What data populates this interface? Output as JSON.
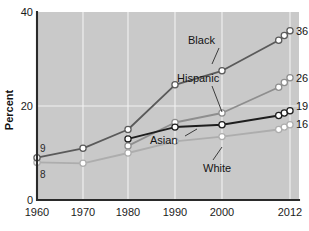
{
  "figure": {
    "plot_bg": "#c9c9c9",
    "page_bg": "#ffffff",
    "grid_color": "#f2f2f2",
    "axis_color": "#2a2a2a"
  },
  "axes": {
    "ylabel": "Percent",
    "yticks": [
      "0",
      "20",
      "40"
    ],
    "xticks": [
      "1960",
      "1970",
      "1980",
      "1990",
      "2000",
      "2012"
    ]
  },
  "start_labels": [
    {
      "text": "9",
      "series": "Black"
    },
    {
      "text": "8",
      "series": "White"
    }
  ],
  "end_labels": [
    {
      "text": "36",
      "series": "Black"
    },
    {
      "text": "26",
      "series": "Hispanic"
    },
    {
      "text": "19",
      "series": "Asian"
    },
    {
      "text": "16",
      "series": "White"
    }
  ],
  "series_labels": [
    {
      "text": "Black"
    },
    {
      "text": "Hispanic"
    },
    {
      "text": "Asian"
    },
    {
      "text": "White"
    }
  ],
  "chart_data": {
    "type": "line",
    "title": "",
    "xlabel": "",
    "ylabel": "Percent",
    "xlim": [
      1960,
      2012
    ],
    "ylim": [
      0,
      40
    ],
    "yticks": [
      0,
      20,
      40
    ],
    "xticks": [
      1960,
      1970,
      1980,
      1990,
      2000,
      2012
    ],
    "grid": true,
    "legend": "inline-annotations",
    "series": [
      {
        "name": "Black",
        "color": "#5a5a5a",
        "x": [
          1960,
          1970,
          1980,
          1990,
          2000,
          2010,
          2011,
          2012
        ],
        "y": [
          9,
          11,
          15,
          24.5,
          27.5,
          34,
          35,
          36
        ],
        "start_value": 9,
        "end_value": 36
      },
      {
        "name": "Hispanic",
        "color": "#8e8e8e",
        "x": [
          1980,
          1990,
          2000,
          2010,
          2011,
          2012
        ],
        "y": [
          11.5,
          16.5,
          18.5,
          24,
          25,
          26
        ],
        "end_value": 26
      },
      {
        "name": "Asian",
        "color": "#1e1e1e",
        "x": [
          1980,
          1990,
          2000,
          2010,
          2011,
          2012
        ],
        "y": [
          13,
          15.5,
          16,
          18,
          18.5,
          19
        ],
        "end_value": 19
      },
      {
        "name": "White",
        "color": "#adadad",
        "x": [
          1960,
          1970,
          1980,
          1990,
          2000,
          2010,
          2011,
          2012
        ],
        "y": [
          8,
          7.8,
          10,
          12.5,
          13.5,
          15,
          15.5,
          16
        ],
        "start_value": 8,
        "end_value": 16
      }
    ]
  }
}
